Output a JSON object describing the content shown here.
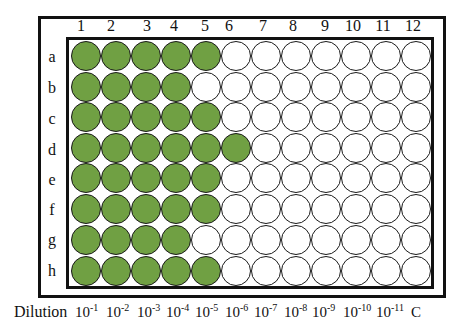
{
  "plate": {
    "columns": [
      "1",
      "2",
      "3",
      "4",
      "5",
      "6",
      "7",
      "8",
      "9",
      "10",
      "11",
      "12"
    ],
    "rows": [
      "a",
      "b",
      "c",
      "d",
      "e",
      "f",
      "g",
      "h"
    ],
    "positive_color": "#70a043",
    "negative_color": "#ffffff",
    "positive_counts_per_row": {
      "a": 5,
      "b": 4,
      "c": 5,
      "d": 6,
      "e": 5,
      "f": 5,
      "g": 4,
      "h": 5
    }
  },
  "dilution": {
    "title": "Dilution",
    "labels": [
      {
        "base": "10",
        "exp": "-1"
      },
      {
        "base": "10",
        "exp": "-2"
      },
      {
        "base": "10",
        "exp": "-3"
      },
      {
        "base": "10",
        "exp": "-4"
      },
      {
        "base": "10",
        "exp": "-5"
      },
      {
        "base": "10",
        "exp": "-6"
      },
      {
        "base": "10",
        "exp": "-7"
      },
      {
        "base": "10",
        "exp": "-8"
      },
      {
        "base": "10",
        "exp": "-9"
      },
      {
        "base": "10",
        "exp": "-10"
      },
      {
        "base": "10",
        "exp": "-11"
      },
      {
        "base": "C",
        "exp": ""
      }
    ]
  }
}
